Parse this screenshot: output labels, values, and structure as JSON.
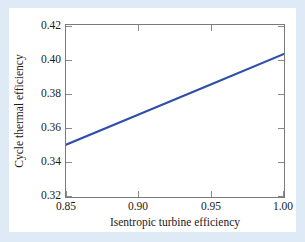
{
  "chart_data": {
    "type": "line",
    "title": "",
    "xlabel": "Isentropic turbine efficiency",
    "ylabel": "Cycle thermal efficiency",
    "xlim": [
      0.85,
      1.0
    ],
    "ylim": [
      0.32,
      0.42
    ],
    "xticks": [
      "0.85",
      "0.90",
      "0.95",
      "1.00"
    ],
    "xtick_values": [
      0.85,
      0.9,
      0.95,
      1.0
    ],
    "yticks": [
      "0.32",
      "0.34",
      "0.36",
      "0.38",
      "0.40",
      "0.42"
    ],
    "ytick_values": [
      0.32,
      0.34,
      0.36,
      0.38,
      0.4,
      0.42
    ],
    "grid": false,
    "legend": null,
    "series": [
      {
        "name": "Cycle thermal efficiency",
        "color": "#2f4fa8",
        "x": [
          0.85,
          0.9,
          0.95,
          1.0
        ],
        "values": [
          0.3504,
          0.368,
          0.3856,
          0.4032
        ]
      }
    ]
  },
  "axes": {
    "x_label": "Isentropic turbine efficiency",
    "y_label": "Cycle thermal efficiency"
  },
  "colors": {
    "line": "#2f4fa8",
    "frame": "#7a7a7a",
    "page_background": "#dfeaf7",
    "figure_background": "#ffffff"
  }
}
